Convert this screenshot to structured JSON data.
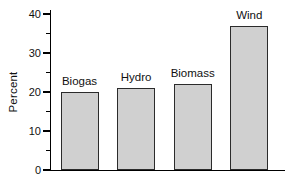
{
  "chart_data": {
    "type": "bar",
    "categories": [
      "Biogas",
      "Hydro",
      "Biomass",
      "Wind"
    ],
    "values": [
      20,
      21,
      22,
      37
    ],
    "title": "",
    "xlabel": "",
    "ylabel": "Percent",
    "ylim": [
      0,
      40
    ],
    "yticks": [
      0,
      10,
      20,
      30,
      40
    ],
    "yticks_minor": [
      5,
      15,
      25,
      35
    ],
    "grid": false,
    "legend": false,
    "bar_value_labels": "category name above each bar"
  },
  "colors": {
    "background": "#ffffff",
    "bar_fill": "#d0d0d0",
    "bar_texture_dot": "#8e8e8e",
    "bar_border": "#2b2b2b",
    "axis": "#000000",
    "text": "#111111"
  }
}
